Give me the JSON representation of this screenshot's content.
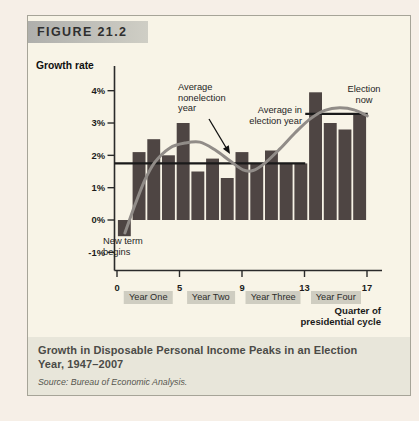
{
  "figure_label": "FIGURE 21.2",
  "chart_data": {
    "type": "bar",
    "title": "Growth in Disposable Personal Income Peaks in an Election Year, 1947–2007",
    "ylabel": "Growth rate",
    "xlabel": "Quarter of presidential cycle",
    "ylim": [
      -1.6,
      4.6
    ],
    "y_ticks": [
      "4%",
      "3%",
      "2%",
      "1%",
      "0%",
      "-1%"
    ],
    "y_tick_values": [
      4,
      3,
      2,
      1,
      0,
      -1
    ],
    "x_ticks": [
      "0",
      "5",
      "9",
      "13",
      "17"
    ],
    "year_bands": [
      "Year One",
      "Year Two",
      "Year Three",
      "Year Four"
    ],
    "values": [
      -0.5,
      2.1,
      2.5,
      2.0,
      3.0,
      1.5,
      1.9,
      1.3,
      2.1,
      1.75,
      2.15,
      1.75,
      1.75,
      3.95,
      3.0,
      2.8,
      3.3
    ],
    "avg_lines": [
      {
        "name": "Average nonelection year",
        "value": 1.75,
        "span_quarters": [
          0,
          12.8
        ]
      },
      {
        "name": "Average in election year",
        "value": 3.28,
        "span_quarters": [
          12.8,
          17.05
        ]
      }
    ],
    "trend_curve": [
      [
        0.54,
        -0.4
      ],
      [
        1.22,
        0.46
      ],
      [
        1.9,
        1.24
      ],
      [
        2.58,
        1.79
      ],
      [
        3.6,
        2.23
      ],
      [
        4.62,
        2.38
      ],
      [
        5.64,
        2.41
      ],
      [
        6.66,
        2.17
      ],
      [
        7.68,
        1.83
      ],
      [
        8.57,
        1.55
      ],
      [
        9.25,
        1.53
      ],
      [
        10.06,
        1.76
      ],
      [
        11.08,
        2.2
      ],
      [
        12.1,
        2.69
      ],
      [
        13.12,
        3.12
      ],
      [
        14.14,
        3.39
      ],
      [
        15.16,
        3.47
      ],
      [
        16.18,
        3.4
      ],
      [
        17.02,
        3.22
      ]
    ],
    "legend_position": "none",
    "grid": false
  },
  "annotations": {
    "avg_nonelection": {
      "lines": [
        "Average",
        "nonelection",
        "year"
      ]
    },
    "avg_election": {
      "lines": [
        "Average in",
        "election year"
      ]
    },
    "election_now": {
      "lines": [
        "Election",
        "now"
      ]
    },
    "new_term": {
      "lines": [
        "New term",
        "begins"
      ]
    },
    "x_axis_label": {
      "lines": [
        "Quarter of",
        "presidential cycle"
      ]
    }
  },
  "caption": {
    "title_lines": [
      "Growth in Disposable Personal Income Peaks in an Election",
      "Year, 1947–2007"
    ],
    "source": "Source: Bureau of Economic Analysis."
  },
  "colors": {
    "bar": "#4e4543",
    "trend_curve": "#918c88",
    "average_line": "#1a1a1a",
    "axis": "#2a2a2a",
    "band_bg": "#cfcdc1",
    "card_bg": "#f8f4e7",
    "caption_bg": "#e8e6da",
    "page_bg": "#f6efe7",
    "header_box": "#afafac"
  }
}
